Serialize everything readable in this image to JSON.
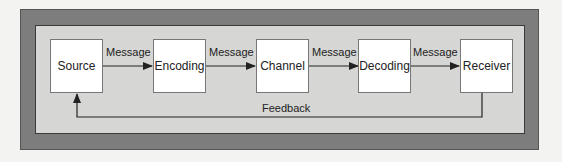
{
  "diagram": {
    "nodes": [
      {
        "id": "source",
        "label": "Source"
      },
      {
        "id": "encoding",
        "label": "Encoding"
      },
      {
        "id": "channel",
        "label": "Channel"
      },
      {
        "id": "decoding",
        "label": "Decoding"
      },
      {
        "id": "receiver",
        "label": "Receiver"
      }
    ],
    "edges": [
      {
        "from": "source",
        "to": "encoding",
        "label": "Message"
      },
      {
        "from": "encoding",
        "to": "channel",
        "label": "Message"
      },
      {
        "from": "channel",
        "to": "decoding",
        "label": "Message"
      },
      {
        "from": "decoding",
        "to": "receiver",
        "label": "Message"
      },
      {
        "from": "receiver",
        "to": "source",
        "label": "Feedback"
      }
    ]
  }
}
